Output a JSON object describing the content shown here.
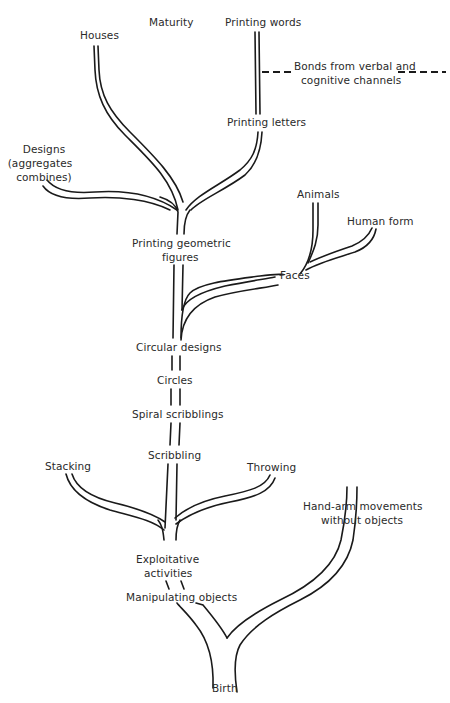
{
  "diagram": {
    "type": "developmental tree",
    "line_color": "#1a1a1a",
    "background": "#ffffff",
    "nodes": {
      "maturity": "Maturity",
      "houses": "Houses",
      "printing_words": "Printing words",
      "bonds_line1": "Bonds from verbal and",
      "bonds_line2": "cognitive channels",
      "printing_letters": "Printing letters",
      "designs_line1": "Designs",
      "designs_line2": "(aggregates",
      "designs_line3": "combines)",
      "animals": "Animals",
      "human_form": "Human form",
      "printing_geometric_line1": "Printing geometric",
      "printing_geometric_line2": "figures",
      "faces": "Faces",
      "circular_designs": "Circular designs",
      "circles": "Circles",
      "spiral_scribblings": "Spiral scribblings",
      "scribbling": "Scribbling",
      "stacking": "Stacking",
      "throwing": "Throwing",
      "hand_arm_line1": "Hand-arm movements",
      "hand_arm_line2": "without objects",
      "exploitative_line1": "Exploitative",
      "exploitative_line2": "activities",
      "manipulating_objects": "Manipulating objects",
      "birth": "Birth"
    },
    "edges": [
      [
        "Birth",
        "Manipulating objects"
      ],
      [
        "Birth",
        "Hand-arm movements without objects"
      ],
      [
        "Manipulating objects",
        "Exploitative activities"
      ],
      [
        "Exploitative activities",
        "Stacking"
      ],
      [
        "Exploitative activities",
        "Throwing"
      ],
      [
        "Exploitative activities",
        "Scribbling"
      ],
      [
        "Scribbling",
        "Spiral scribblings"
      ],
      [
        "Spiral scribblings",
        "Circles"
      ],
      [
        "Circles",
        "Circular designs"
      ],
      [
        "Circular designs",
        "Faces"
      ],
      [
        "Faces",
        "Animals"
      ],
      [
        "Faces",
        "Human form"
      ],
      [
        "Circular designs",
        "Printing geometric figures"
      ],
      [
        "Printing geometric figures",
        "Designs (aggregates combines)"
      ],
      [
        "Printing geometric figures",
        "Houses"
      ],
      [
        "Printing geometric figures",
        "Printing letters"
      ],
      [
        "Printing letters",
        "Printing words"
      ],
      [
        "Bonds from verbal and cognitive channels",
        "Printing words (dashed)"
      ]
    ]
  }
}
